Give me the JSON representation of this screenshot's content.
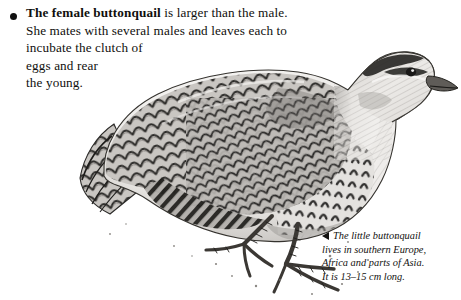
{
  "page": {
    "background_color": "#ffffff",
    "width": 461,
    "height": 300
  },
  "fact": {
    "bullet_icon": "bullet-dot-icon",
    "lead_bold": "The female buttonquail",
    "line1_rest": " is larger than the male.",
    "line2": "She mates with several males and leaves each to",
    "line3": "incubate the clutch of",
    "line4": "eggs and rear",
    "line5": "the young.",
    "text_color": "#100f0d"
  },
  "caption": {
    "marker_icon": "left-pointing-triangle-icon",
    "line1": "The little buttonquail",
    "line2": "lives in southern Europe,",
    "line3": "Africa and parts of Asia.",
    "line4": "It is 13–15 cm long.",
    "text_color": "#131210"
  },
  "illustration": {
    "subject": "little buttonquail",
    "style": "black-and-white engraving",
    "ink_color": "#262524",
    "mid_tone": "#8d8b88",
    "light_tone": "#d3d1ce",
    "eye_color": "#1a1918"
  }
}
